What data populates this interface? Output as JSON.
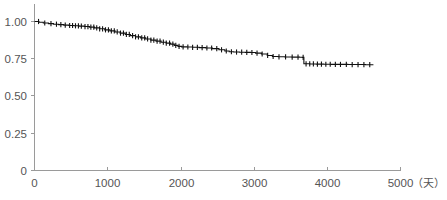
{
  "chart_data": {
    "type": "line",
    "title": "",
    "subtitle": "",
    "xlabel": "（天）",
    "ylabel": "",
    "xlim": [
      0,
      5000
    ],
    "ylim": [
      0,
      1.0
    ],
    "grid": false,
    "legend": null,
    "curve_style": "kaplan-meier step with censoring ticks",
    "x_ticks": [
      0,
      1000,
      2000,
      3000,
      4000,
      5000
    ],
    "x_tick_labels": [
      "0",
      "1000",
      "2000",
      "3000",
      "4000",
      "5000"
    ],
    "y_ticks": [
      0,
      0.25,
      0.5,
      0.75,
      1.0
    ],
    "y_tick_labels": [
      "0",
      "0.25",
      "0.50",
      "0.75",
      "1.00"
    ],
    "series": [
      {
        "name": "survival",
        "color": "#111111",
        "x": [
          0,
          60,
          120,
          190,
          260,
          330,
          400,
          470,
          540,
          610,
          680,
          750,
          820,
          890,
          960,
          1030,
          1100,
          1170,
          1240,
          1310,
          1380,
          1450,
          1520,
          1590,
          1660,
          1730,
          1800,
          1860,
          1910,
          1960,
          2010,
          2080,
          2160,
          2250,
          2340,
          2430,
          2520,
          2600,
          2660,
          2720,
          2800,
          2880,
          2950,
          3020,
          3100,
          3180,
          3250,
          3330,
          3420,
          3520,
          3620,
          3660,
          3680,
          3760,
          3850,
          3950,
          4050,
          4160,
          4280,
          4400,
          4520,
          4630
        ],
        "y": [
          1.0,
          0.995,
          0.99,
          0.986,
          0.982,
          0.979,
          0.976,
          0.973,
          0.971,
          0.969,
          0.966,
          0.962,
          0.957,
          0.951,
          0.944,
          0.937,
          0.93,
          0.922,
          0.913,
          0.905,
          0.897,
          0.89,
          0.883,
          0.875,
          0.868,
          0.861,
          0.855,
          0.848,
          0.84,
          0.833,
          0.83,
          0.829,
          0.827,
          0.825,
          0.822,
          0.818,
          0.81,
          0.802,
          0.797,
          0.795,
          0.794,
          0.793,
          0.792,
          0.788,
          0.782,
          0.772,
          0.765,
          0.763,
          0.762,
          0.761,
          0.76,
          0.759,
          0.716,
          0.715,
          0.714,
          0.713,
          0.712,
          0.712,
          0.711,
          0.711,
          0.71,
          0.71
        ]
      }
    ],
    "censor_x": [
      55,
      140,
      225,
      300,
      360,
      420,
      480,
      520,
      560,
      600,
      640,
      690,
      730,
      770,
      810,
      850,
      890,
      930,
      970,
      1010,
      1050,
      1090,
      1130,
      1175,
      1215,
      1255,
      1295,
      1340,
      1380,
      1420,
      1465,
      1505,
      1545,
      1590,
      1630,
      1675,
      1715,
      1760,
      1800,
      1845,
      1890,
      1930,
      1975,
      2030,
      2095,
      2160,
      2225,
      2290,
      2355,
      2420,
      2490,
      2555,
      2620,
      2690,
      2760,
      2830,
      2900,
      2970,
      3040,
      3110,
      3185,
      3260,
      3340,
      3430,
      3520,
      3600,
      3670,
      3710,
      3760,
      3810,
      3865,
      3920,
      3980,
      4040,
      4110,
      4180,
      4260,
      4340,
      4420,
      4500,
      4580
    ],
    "start_value": 1.0,
    "end_value": 0.71,
    "end_x": 4630,
    "notable_drop": {
      "x": 3675,
      "from": 0.759,
      "to": 0.716
    }
  },
  "axis": {
    "unit_label": "（天）",
    "y_labels": [
      "1.00",
      "0.75",
      "0.50",
      "0.25",
      "0"
    ],
    "x_labels": [
      "0",
      "1000",
      "2000",
      "3000",
      "4000",
      "5000"
    ]
  },
  "colors": {
    "curve": "#111111",
    "axis": "#9a9a9a",
    "text": "#555555",
    "background": "#ffffff"
  }
}
